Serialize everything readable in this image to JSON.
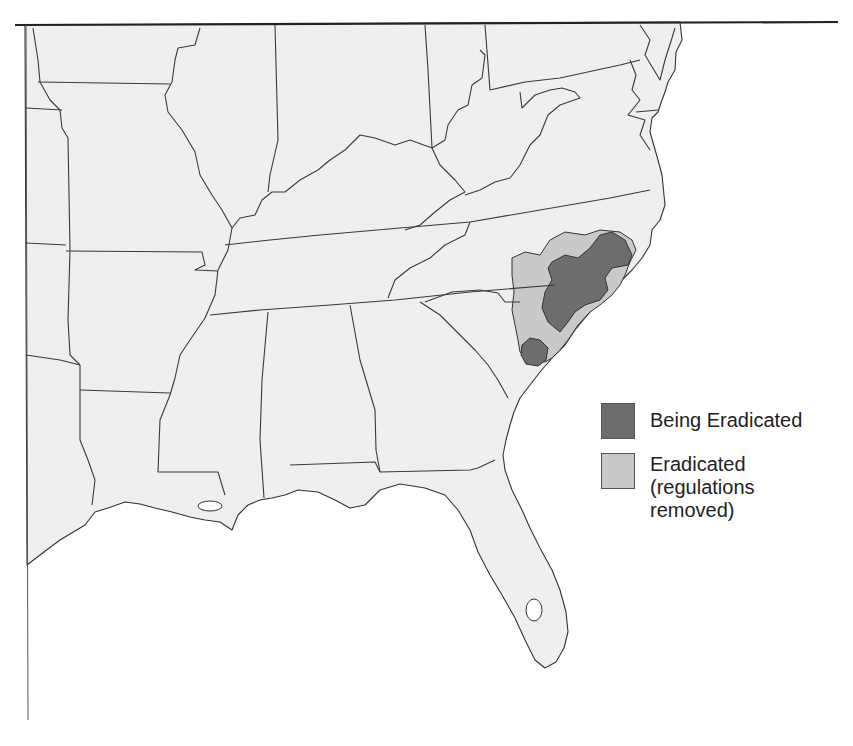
{
  "map": {
    "region": "Southeastern United States",
    "frame_top_line": true
  },
  "legend": {
    "items": [
      {
        "label": "Being Eradicated",
        "color": "#6d6d6d"
      },
      {
        "label": "Eradicated\n(regulations\nremoved)",
        "color": "#c9c9c9"
      }
    ]
  }
}
